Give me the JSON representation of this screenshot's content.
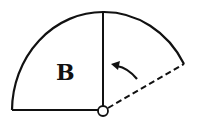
{
  "diagram": {
    "region_label": "B",
    "elements": {
      "sector": "solid quarter-sector outline (left), bounded by horizontal base and vertical radius",
      "extension_arc": "solid arc continuing clockwise beyond vertical radius",
      "dashed_radius": "dashed line from pivot to end of arc",
      "pivot": "small open circle at center",
      "arrow": "curved arrow indicating counter-clockwise rotation toward vertical radius"
    },
    "colors": {
      "stroke": "#111111",
      "background": "#ffffff"
    }
  }
}
